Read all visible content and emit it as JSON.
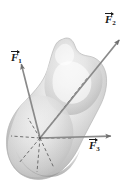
{
  "figure": {
    "kind": "physics-free-body-diagram",
    "background_color": "#ffffff",
    "body": {
      "name": "rigid-body-blob",
      "fill_light": "#fcfcfc",
      "fill_mid": "#cfcfcf",
      "fill_dark": "#9e9e9e",
      "outline_color": "#b0b0b0"
    },
    "origin_point": {
      "x": 40,
      "y": 138,
      "label": ""
    },
    "vectors": [
      {
        "id": "F1",
        "label_base": "F",
        "label_sub": "1",
        "arrow_color": "#8a8a8a",
        "head_color": "#6e6e6e",
        "tail": {
          "x": 40,
          "y": 138
        },
        "tip": {
          "x": 21,
          "y": 63
        },
        "label_position": {
          "x": 11,
          "y": 49
        }
      },
      {
        "id": "F2",
        "label_base": "F",
        "label_sub": "2",
        "arrow_color": "#8a8a8a",
        "head_color": "#6e6e6e",
        "tail": {
          "x": 40,
          "y": 138
        },
        "tip": {
          "x": 120,
          "y": 39
        },
        "label_position": {
          "x": 105,
          "y": 11
        }
      },
      {
        "id": "F3",
        "label_base": "F",
        "label_sub": "3",
        "arrow_color": "#8a8a8a",
        "head_color": "#6e6e6e",
        "tail": {
          "x": 40,
          "y": 138
        },
        "tip": {
          "x": 112,
          "y": 136
        },
        "label_position": {
          "x": 89,
          "y": 137
        }
      }
    ],
    "dashed_lines": [
      {
        "id": "dash-up-right",
        "from": {
          "x": 40,
          "y": 138
        },
        "to": {
          "x": 88,
          "y": 77
        }
      },
      {
        "id": "dash-left",
        "from": {
          "x": 40,
          "y": 138
        },
        "to": {
          "x": 11,
          "y": 136
        }
      },
      {
        "id": "dash-right",
        "from": {
          "x": 40,
          "y": 138
        },
        "to": {
          "x": 74,
          "y": 138
        }
      },
      {
        "id": "dash-down",
        "from": {
          "x": 40,
          "y": 138
        },
        "to": {
          "x": 37,
          "y": 172
        }
      },
      {
        "id": "dash-down-left",
        "from": {
          "x": 40,
          "y": 138
        },
        "to": {
          "x": 19,
          "y": 163
        }
      },
      {
        "id": "dash-down-right",
        "from": {
          "x": 40,
          "y": 138
        },
        "to": {
          "x": 54,
          "y": 168
        }
      },
      {
        "id": "dash-up-left",
        "from": {
          "x": 40,
          "y": 138
        },
        "to": {
          "x": 28,
          "y": 118
        }
      }
    ]
  }
}
